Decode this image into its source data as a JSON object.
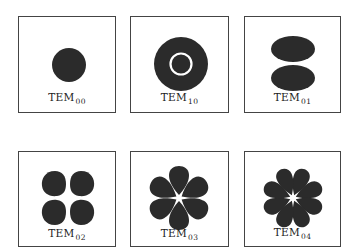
{
  "figure": {
    "colors": {
      "spot": "#2b2b2b",
      "border": "#444444",
      "background": "#ffffff"
    },
    "panels": [
      {
        "id": "tem00",
        "label": "TEM",
        "subscript": "00",
        "pattern": "single-spot"
      },
      {
        "id": "tem10",
        "label": "TEM",
        "subscript": "10",
        "pattern": "spot-with-ring-node"
      },
      {
        "id": "tem01",
        "label": "TEM",
        "subscript": "01",
        "pattern": "two-lobes-vertical"
      },
      {
        "id": "tem02",
        "label": "TEM",
        "subscript": "02",
        "pattern": "four-lobes"
      },
      {
        "id": "tem03",
        "label": "TEM",
        "subscript": "03",
        "pattern": "six-petals"
      },
      {
        "id": "tem04",
        "label": "TEM",
        "subscript": "04",
        "pattern": "eight-petals"
      }
    ]
  }
}
